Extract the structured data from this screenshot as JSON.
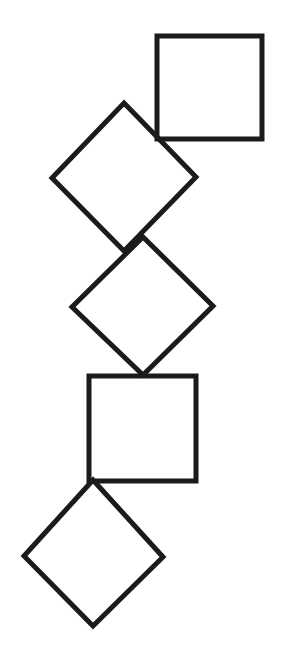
{
  "canvas": {
    "width": 283,
    "height": 663,
    "background_color": "#ffffff"
  },
  "style": {
    "stroke_color": "#1b1b1b",
    "fill": "none",
    "stroke_width": 5,
    "stroke_width_label": "5"
  },
  "figure": {
    "title": "Chain of five overlapping squares",
    "shape_count": 5
  },
  "shapes": [
    {
      "id": "shape-1",
      "name": "square-upright-top",
      "kind": "square",
      "orientation": "axis-aligned",
      "rotation_deg": 0,
      "points": "157,36 262,36 262,139 157,139",
      "center": "209.5,87.5",
      "side": 105,
      "bbox": "157,36,105,103"
    },
    {
      "id": "shape-2",
      "name": "diamond-upper",
      "kind": "square",
      "orientation": "rotated",
      "rotation_deg": 45,
      "points": "124,103 196,177 124,251 52,178",
      "center": "124,177",
      "side": 103,
      "bbox": "52,103,144,148"
    },
    {
      "id": "shape-3",
      "name": "diamond-middle",
      "kind": "square",
      "orientation": "rotated",
      "rotation_deg": 45,
      "points": "143,237 213,306 143,375 72,307",
      "center": "143,306",
      "side": 98,
      "bbox": "72,237,141,138"
    },
    {
      "id": "shape-4",
      "name": "square-upright-lower",
      "kind": "square",
      "orientation": "axis-aligned",
      "rotation_deg": 0,
      "points": "89,376 196,376 196,481 89,481",
      "center": "142.5,428.5",
      "side": 107,
      "bbox": "89,376,107,105"
    },
    {
      "id": "shape-5",
      "name": "diamond-bottom",
      "kind": "square",
      "orientation": "rotated",
      "rotation_deg": 45,
      "points": "93,480 163,557 93,626 24,556",
      "center": "93,556",
      "side": 98,
      "bbox": "24,480,139,146"
    }
  ]
}
